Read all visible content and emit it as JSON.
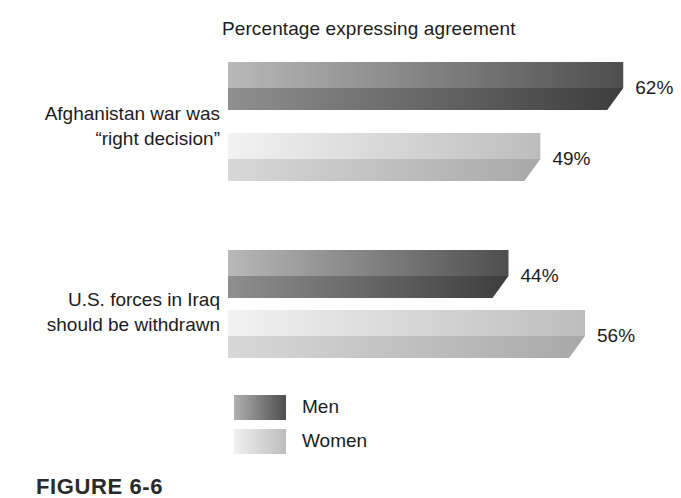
{
  "chart_data": {
    "type": "bar",
    "orientation": "horizontal",
    "title": "Percentage expressing agreement",
    "xlabel": "",
    "ylabel": "",
    "xlim": [
      0,
      70
    ],
    "grid": false,
    "legend_position": "bottom-center",
    "categories": [
      {
        "lines": [
          "Afghanistan war was",
          "“right decision”"
        ]
      },
      {
        "lines": [
          "U.S. forces in Iraq",
          "should be withdrawn"
        ]
      }
    ],
    "series": [
      {
        "name": "Men",
        "color": "#8c8c8c",
        "color_dark": "#5a5a5a",
        "values": [
          62,
          49
        ],
        "value_labels": [
          "62%",
          "44%"
        ]
      },
      {
        "name": "Women",
        "color": "#d2d2d2",
        "color_dark": "#b4b4b4",
        "values": [
          49,
          56
        ],
        "value_labels": [
          "49%",
          "56%"
        ]
      }
    ],
    "bars": [
      {
        "group": 0,
        "series": "Men",
        "value": 62,
        "label": "62%"
      },
      {
        "group": 0,
        "series": "Women",
        "value": 49,
        "label": "49%"
      },
      {
        "group": 1,
        "series": "Men",
        "value": 44,
        "label": "44%"
      },
      {
        "group": 1,
        "series": "Women",
        "value": 56,
        "label": "56%"
      }
    ],
    "legend": [
      "Men",
      "Women"
    ]
  },
  "figure": {
    "caption": "FIGURE 6-6"
  }
}
